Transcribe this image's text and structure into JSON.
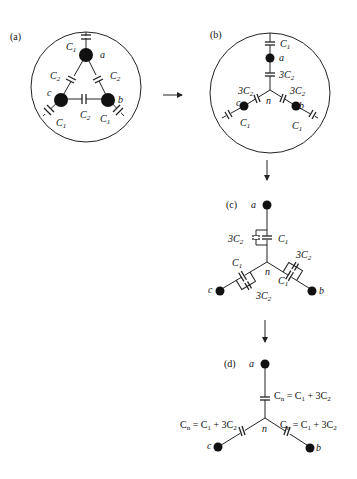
{
  "panels": {
    "a": {
      "label": "(a)",
      "nodes": [
        "a",
        "b",
        "c"
      ],
      "caps": {
        "ground": "C1",
        "mutual": "C2"
      }
    },
    "b": {
      "label": "(b)",
      "nodes": [
        "a",
        "b",
        "c",
        "n"
      ],
      "caps": {
        "ground": "C1",
        "star": "3C2"
      }
    },
    "c": {
      "label": "(c)",
      "nodes": [
        "a",
        "b",
        "c",
        "n"
      ],
      "caps": {
        "parallel": [
          "3C2",
          "C1"
        ]
      }
    },
    "d": {
      "label": "(d)",
      "nodes": [
        "a",
        "b",
        "c",
        "n"
      ],
      "equation": "Cn = C1 + 3C2"
    }
  },
  "text": {
    "pa": "(a)",
    "pb": "(b)",
    "pc": "(c)",
    "pd": "(d)",
    "na": "a",
    "nb": "b",
    "nc": "c",
    "nn": "n",
    "C": "C",
    "one": "1",
    "two": "2",
    "three": "3",
    "n_sub": "n",
    "eq_rest": " = C",
    "plus3": " + 3C"
  }
}
